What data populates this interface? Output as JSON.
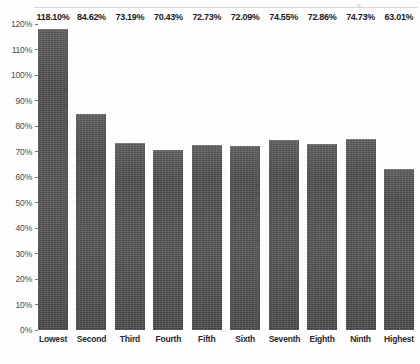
{
  "chart_data": {
    "type": "bar",
    "title": "",
    "xlabel": "",
    "ylabel": "",
    "categories": [
      "Lowest",
      "Second",
      "Third",
      "Fourth",
      "Fifth",
      "Sixth",
      "Seventh",
      "Eighth",
      "Ninth",
      "Highest"
    ],
    "values": [
      118.1,
      84.62,
      73.19,
      70.43,
      72.73,
      72.09,
      74.55,
      72.86,
      74.73,
      63.01
    ],
    "value_labels": [
      "118.10%",
      "84.62%",
      "73.19%",
      "70.43%",
      "72.73%",
      "72.09%",
      "74.55%",
      "72.86%",
      "74.73%",
      "63.01%"
    ],
    "ylim": [
      0,
      120
    ],
    "ytick_values": [
      0,
      10,
      20,
      30,
      40,
      50,
      60,
      70,
      80,
      90,
      100,
      110,
      120
    ],
    "ytick_labels": [
      "0%",
      "10%",
      "20%",
      "30%",
      "40%",
      "50%",
      "60%",
      "70%",
      "80%",
      "90%",
      "100%",
      "110%",
      "120%"
    ],
    "grid": false,
    "legend": "none",
    "bar_color": "#4b4b4b",
    "label_color": "#1c1c1c"
  }
}
